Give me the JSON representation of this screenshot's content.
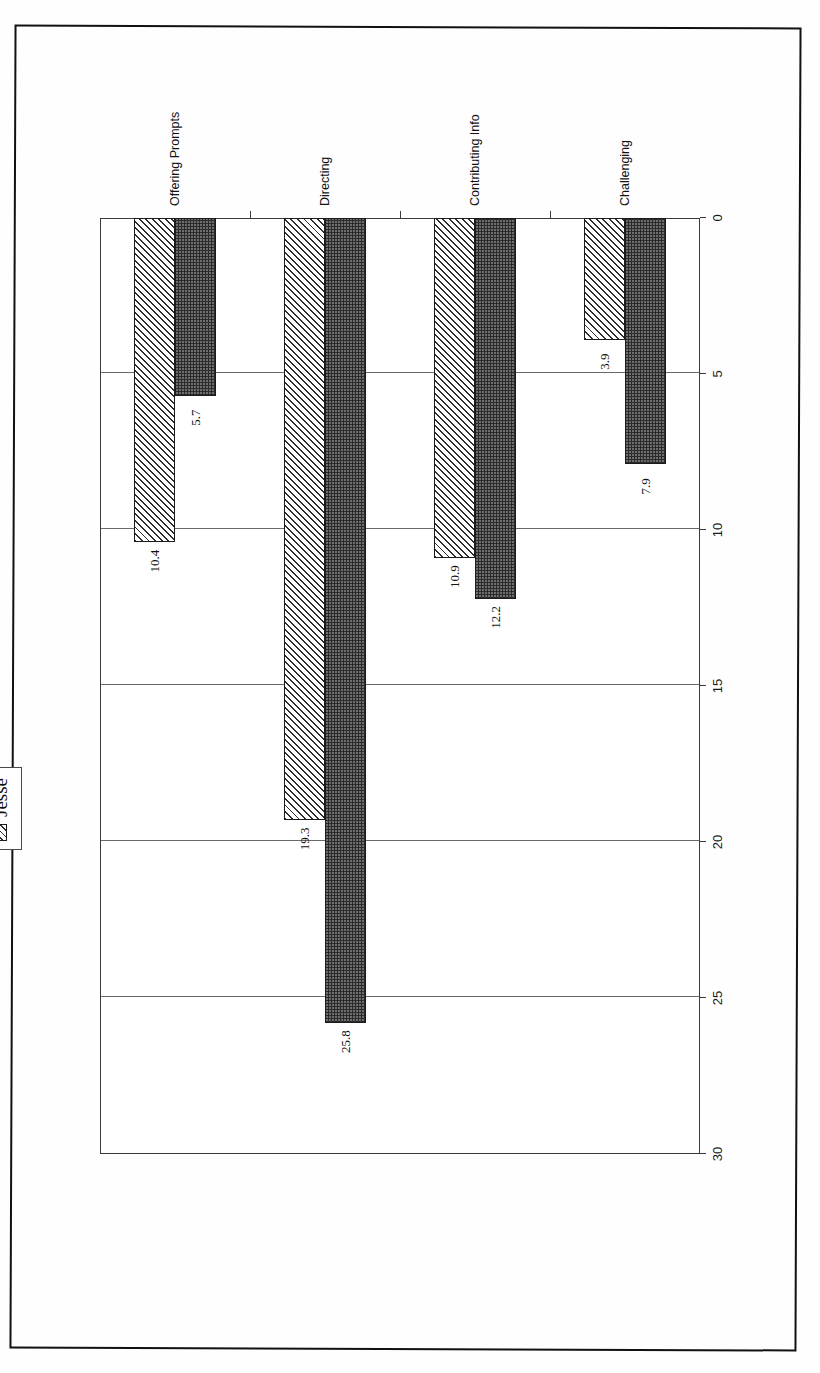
{
  "chart_data": {
    "type": "bar",
    "orientation": "horizontal",
    "title": "",
    "subtitle": "",
    "xlabel": "",
    "ylabel": "",
    "categories": [
      "Challenging",
      "Contributing Info",
      "Directing",
      "Offering Prompts"
    ],
    "series": [
      {
        "name": "Neil",
        "values": [
          7.9,
          12.2,
          25.8,
          5.7
        ]
      },
      {
        "name": "Jesse",
        "values": [
          3.9,
          10.9,
          19.3,
          10.4
        ]
      }
    ],
    "value_ticks": [
      0,
      5,
      10,
      15,
      20,
      25,
      30
    ],
    "value_tick_labels": [
      "0",
      "5",
      "10",
      "15",
      "20",
      "25",
      "30"
    ],
    "vlim": [
      0,
      30
    ],
    "grid": true,
    "legend_position": "top-left-outside",
    "data_labels": [
      "7.9",
      "3.9",
      "12.2",
      "10.9",
      "25.8",
      "19.3",
      "5.7",
      "10.4"
    ],
    "colors": {
      "neil_fill": "#6e6e6e",
      "neil_pattern": "#2b2b2b",
      "jesse_fill": "#f2f2f2",
      "jesse_pattern": "#2e2e2e",
      "axis": "#3b3b3b",
      "gridline": "#6a6a6a",
      "page_border": "#111111",
      "background": "#ffffff"
    }
  },
  "legend": {
    "items": [
      {
        "label": "Neil",
        "swatch": "neil-swatch"
      },
      {
        "label": "Jesse",
        "swatch": "jesse-swatch"
      }
    ]
  }
}
